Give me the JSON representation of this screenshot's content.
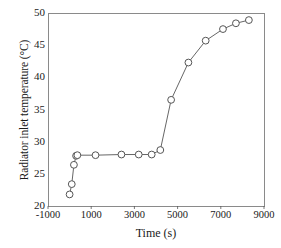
{
  "chart_data": {
    "type": "line",
    "title": "",
    "xlabel": "Time (s)",
    "ylabel": "Radiator inlet temperature (°C)",
    "xlim": [
      -1000,
      9000
    ],
    "ylim": [
      20,
      50
    ],
    "xticks": [
      -1000,
      1000,
      3000,
      5000,
      7000,
      9000
    ],
    "xtick_labels": [
      "-1000",
      "1000",
      "3000",
      "5000",
      "7000",
      "9000"
    ],
    "yticks": [
      20,
      25,
      30,
      35,
      40,
      45,
      50
    ],
    "ytick_labels": [
      "20",
      "25",
      "30",
      "35",
      "40",
      "45",
      "50"
    ],
    "grid": false,
    "legend": null,
    "series": [
      {
        "name": "Radiator inlet temperature",
        "marker": "open-circle",
        "marker_color": "#ffffff",
        "marker_edge_color": "#555555",
        "line_color": "#555555",
        "x": [
          0,
          100,
          200,
          300,
          360,
          1200,
          2400,
          3200,
          3800,
          4200,
          4700,
          5500,
          6300,
          7100,
          7700,
          8300
        ],
        "y": [
          21.8,
          23.4,
          26.4,
          27.8,
          27.9,
          27.9,
          28.0,
          28.0,
          28.0,
          28.7,
          36.5,
          42.3,
          45.7,
          47.5,
          48.4,
          48.9
        ]
      }
    ]
  },
  "axes": {
    "frame_color": "#8a8a8a",
    "tick_color": "#555555"
  }
}
